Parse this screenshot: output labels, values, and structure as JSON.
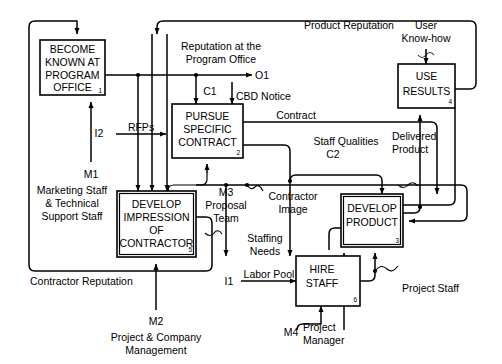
{
  "diagram": {
    "type": "process-flow-diagram",
    "boxes": [
      {
        "id": "a1",
        "number": "1",
        "lines": [
          "BECOME",
          "KNOWN AT",
          "PROGRAM",
          "OFFICE"
        ]
      },
      {
        "id": "a2",
        "number": "2",
        "lines": [
          "PURSUE",
          "SPECIFIC",
          "CONTRACT"
        ]
      },
      {
        "id": "a5",
        "number": "5",
        "lines": [
          "DEVELOP",
          "IMPRESSION",
          "OF",
          "CONTRACTOR"
        ]
      },
      {
        "id": "a3",
        "number": "3",
        "lines": [
          "DEVELOP",
          "PRODUCT"
        ]
      },
      {
        "id": "a6",
        "number": "6",
        "lines": [
          "HIRE",
          "STAFF"
        ]
      },
      {
        "id": "a4",
        "number": "4",
        "lines": [
          "USE",
          "RESULTS"
        ]
      }
    ],
    "labels": {
      "reputation_program_office": [
        "Reputation at the",
        "Program Office"
      ],
      "product_reputation": "Product Reputation",
      "user_knowhow": [
        "User",
        "Know-how"
      ],
      "cbd_notice": "CBD Notice",
      "contract": "Contract",
      "staff_qualities": "Staff Qualities",
      "delivered_product": [
        "Delivered",
        "Product"
      ],
      "rfps": "RFPs",
      "marketing_staff": [
        "Marketing Staff",
        "& Technical",
        "Support Staff"
      ],
      "proposal_team": [
        "Proposal",
        "Team"
      ],
      "contractor_image": [
        "Contractor",
        "Image"
      ],
      "staffing_needs": [
        "Staffing",
        "Needs"
      ],
      "contractor_reputation": "Contractor Reputation",
      "project_company_management": [
        "Project & Company",
        "Management"
      ],
      "labor_pool": "Labor Pool",
      "project_manager": [
        "Project",
        "Manager"
      ],
      "project_staff": "Project Staff"
    },
    "icom_codes": {
      "o1": "O1",
      "c1": "C1",
      "c2": "C2",
      "i1": "I1",
      "i2": "I2",
      "m1": "M1",
      "m2": "M2",
      "m3": "M3",
      "m4": "M4"
    },
    "colors": {
      "line": "#000000",
      "box_fill": "#ffffff",
      "background": "#ffffff",
      "text": "#000000"
    }
  }
}
